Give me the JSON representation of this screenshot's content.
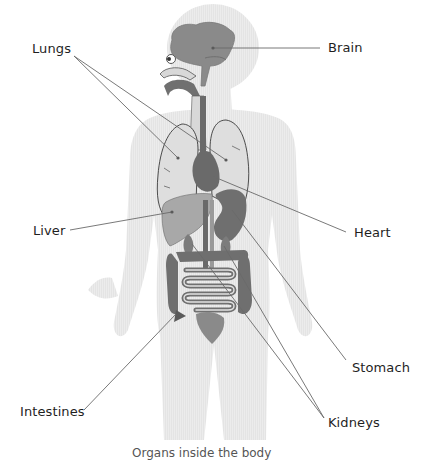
{
  "figure": {
    "caption": "Organs inside the body",
    "colors": {
      "background": "#ffffff",
      "body_silhouette": "#e6e6e6",
      "organ_dark": "#707070",
      "organ_mid": "#8c8c8c",
      "organ_light": "#d9d9d9",
      "liver": "#a8a8a8",
      "leader_line": "#6a6a6a",
      "label_text": "#1f1f1f",
      "caption_text": "#555555"
    }
  },
  "labels": {
    "brain": "Brain",
    "lungs": "Lungs",
    "liver": "Liver",
    "heart": "Heart",
    "stomach": "Stomach",
    "intestines": "Intestines",
    "kidneys": "Kidneys"
  }
}
